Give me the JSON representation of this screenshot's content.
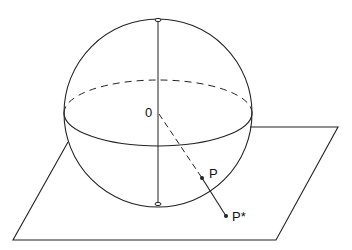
{
  "diagram": {
    "labels": {
      "center": "0",
      "point": "P",
      "projection": "P*"
    },
    "colors": {
      "stroke": "#222222",
      "background": "#ffffff"
    }
  }
}
